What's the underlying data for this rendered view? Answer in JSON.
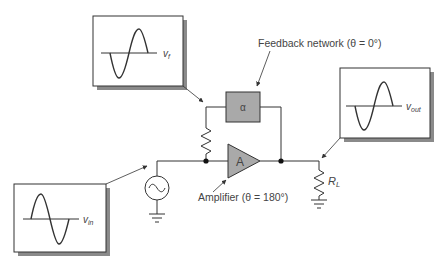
{
  "diagram": {
    "waveforms": {
      "feedback": {
        "label_main": "v",
        "label_sub": "f"
      },
      "output": {
        "label_main": "v",
        "label_sub": "out"
      },
      "input": {
        "label_main": "v",
        "label_sub": "in"
      }
    },
    "feedback_network": {
      "label": "Feedback network (θ = 0°)",
      "symbol": "α"
    },
    "amplifier": {
      "label": "Amplifier (θ = 180°)",
      "symbol": "A"
    },
    "load": {
      "label_main": "R",
      "label_sub": "L"
    },
    "colors": {
      "block_fill": "#a9a9a9",
      "line": "#333333",
      "shadow": "#8a8a8a",
      "text": "#444444"
    }
  }
}
